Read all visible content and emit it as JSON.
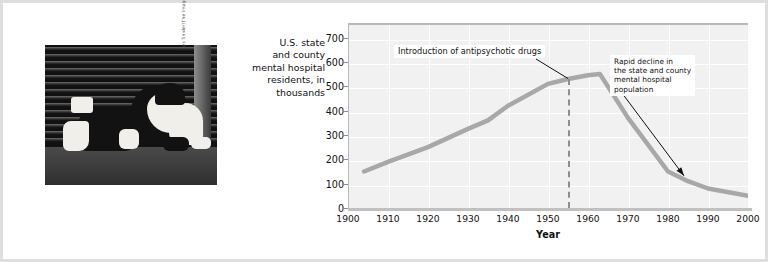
{
  "figure": {
    "photo": {
      "alt_description": "black-and-white photograph of a homeless person sleeping on a city sidewalk against a corrugated metal shutter",
      "credit": "Les Snider/The Image Works"
    }
  },
  "chart_data": {
    "type": "line",
    "title": "",
    "ylabel_lines": [
      "U.S. state",
      "and county",
      "mental hospital",
      "residents, in",
      "thousands"
    ],
    "xlabel": "Year",
    "xlim": [
      1900,
      2000
    ],
    "ylim": [
      0,
      760
    ],
    "xticks": [
      1900,
      1910,
      1920,
      1930,
      1940,
      1950,
      1960,
      1970,
      1980,
      1990,
      2000
    ],
    "yticks": [
      0,
      100,
      200,
      300,
      400,
      500,
      600,
      700
    ],
    "grid": true,
    "legend": "none",
    "series": [
      {
        "name": "U.S. state and county mental hospital residents",
        "color": "#a8a8a8",
        "x": [
          1904,
          1910,
          1920,
          1930,
          1935,
          1940,
          1950,
          1955,
          1960,
          1963,
          1970,
          1980,
          1985,
          1990,
          2000
        ],
        "values": [
          150,
          190,
          250,
          325,
          360,
          420,
          510,
          530,
          545,
          550,
          370,
          150,
          110,
          80,
          50
        ]
      }
    ],
    "annotations": [
      {
        "id": "introduction-of-antipsychotic-drugs",
        "text": "Introduction of antipsychotic drugs",
        "marker": "dashed-vertical-line",
        "marker_x": 1955
      },
      {
        "id": "rapid-decline",
        "text_lines": [
          "Rapid decline in",
          "the state and county",
          "mental hospital",
          "population"
        ],
        "marker": "arrow",
        "points_to_x": 1985
      }
    ]
  }
}
